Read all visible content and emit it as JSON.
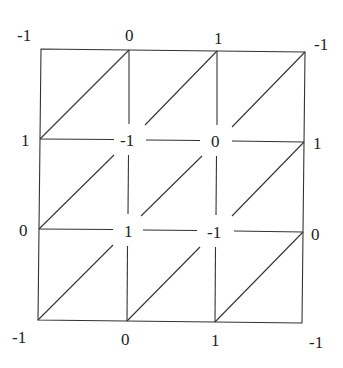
{
  "diagram": {
    "type": "triangulated-grid",
    "grid_size": 3,
    "line_color": "#333333",
    "label_color": "#222222",
    "nodes": [
      {
        "row": 0,
        "col": 0,
        "label": "-1"
      },
      {
        "row": 0,
        "col": 1,
        "label": "0"
      },
      {
        "row": 0,
        "col": 2,
        "label": "1"
      },
      {
        "row": 0,
        "col": 3,
        "label": "-1"
      },
      {
        "row": 1,
        "col": 0,
        "label": "1"
      },
      {
        "row": 1,
        "col": 1,
        "label": "-1"
      },
      {
        "row": 1,
        "col": 2,
        "label": "0"
      },
      {
        "row": 1,
        "col": 3,
        "label": "1"
      },
      {
        "row": 2,
        "col": 0,
        "label": "0"
      },
      {
        "row": 2,
        "col": 1,
        "label": "1"
      },
      {
        "row": 2,
        "col": 2,
        "label": "-1"
      },
      {
        "row": 2,
        "col": 3,
        "label": "0"
      },
      {
        "row": 3,
        "col": 0,
        "label": "-1"
      },
      {
        "row": 3,
        "col": 1,
        "label": "0"
      },
      {
        "row": 3,
        "col": 2,
        "label": "1"
      },
      {
        "row": 3,
        "col": 3,
        "label": "-1"
      }
    ]
  }
}
